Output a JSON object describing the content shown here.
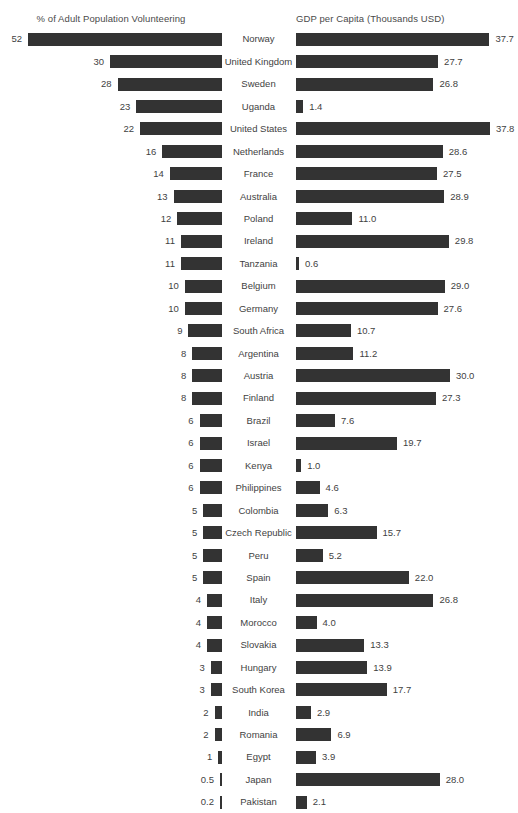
{
  "chart_data": {
    "type": "bar",
    "subtype": "diverging-paired-bar",
    "title": "",
    "left_axis_label": "% of Adult Population Volunteering",
    "right_axis_label": "GDP per Capita (Thousands USD)",
    "categories": [
      "Norway",
      "United Kingdom",
      "Sweden",
      "Uganda",
      "United States",
      "Netherlands",
      "France",
      "Australia",
      "Poland",
      "Ireland",
      "Tanzania",
      "Belgium",
      "Germany",
      "South Africa",
      "Argentina",
      "Austria",
      "Finland",
      "Brazil",
      "Israel",
      "Kenya",
      "Philippines",
      "Colombia",
      "Czech Republic",
      "Peru",
      "Spain",
      "Italy",
      "Morocco",
      "Slovakia",
      "Hungary",
      "South Korea",
      "India",
      "Romania",
      "Egypt",
      "Japan",
      "Pakistan"
    ],
    "series": [
      {
        "name": "% of Adult Population Volunteering",
        "side": "left",
        "unit": "%",
        "max": 52,
        "values": [
          52,
          30,
          28,
          23,
          22,
          16,
          14,
          13,
          12,
          11,
          11,
          10,
          10,
          9,
          8,
          8,
          8,
          6,
          6,
          6,
          6,
          5,
          5,
          5,
          5,
          4,
          4,
          4,
          3,
          3,
          2,
          2,
          1,
          0.5,
          0.2
        ],
        "labels": [
          "52",
          "30",
          "28",
          "23",
          "22",
          "16",
          "14",
          "13",
          "12",
          "11",
          "11",
          "10",
          "10",
          "9",
          "8",
          "8",
          "8",
          "6",
          "6",
          "6",
          "6",
          "5",
          "5",
          "5",
          "5",
          "4",
          "4",
          "4",
          "3",
          "3",
          "2",
          "2",
          "1",
          "0.5",
          "0.2"
        ]
      },
      {
        "name": "GDP per Capita (Thousands USD)",
        "side": "right",
        "unit": "Thousands USD",
        "max": 37.8,
        "values": [
          37.7,
          27.7,
          26.8,
          1.4,
          37.8,
          28.6,
          27.5,
          28.9,
          11.0,
          29.8,
          0.6,
          29.0,
          27.6,
          10.7,
          11.2,
          30.0,
          27.3,
          7.6,
          19.7,
          1.0,
          4.6,
          6.3,
          15.7,
          5.2,
          22.0,
          26.8,
          4.0,
          13.3,
          13.9,
          17.7,
          2.9,
          6.9,
          3.9,
          28.0,
          2.1
        ],
        "labels": [
          "37.7",
          "27.7",
          "26.8",
          "1.4",
          "37.8",
          "28.6",
          "27.5",
          "28.9",
          "11.0",
          "29.8",
          "0.6",
          "29.0",
          "27.6",
          "10.7",
          "11.2",
          "30.0",
          "27.3",
          "7.6",
          "19.7",
          "1.0",
          "4.6",
          "6.3",
          "15.7",
          "5.2",
          "22.0",
          "26.8",
          "4.0",
          "13.3",
          "13.9",
          "17.7",
          "2.9",
          "6.9",
          "3.9",
          "28.0",
          "2.1"
        ]
      }
    ],
    "sorted_by": "% of Adult Population Volunteering, descending",
    "grid": false,
    "legend": "none",
    "colors": {
      "bar": "#333333",
      "text": "#3f3f3f",
      "header_text": "#4a4a4a",
      "background": "#ffffff"
    },
    "scale": {
      "left_px_per_unit": 3.73,
      "right_px_per_unit": 5.13,
      "bar_height_px": 13,
      "row_height_px": 22.45
    }
  }
}
